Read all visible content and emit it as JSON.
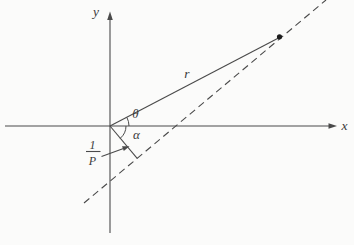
{
  "figure": {
    "canvas": {
      "width": 354,
      "height": 245,
      "background": "#fbfbfa"
    },
    "style": {
      "stroke_color": "#4a4a4a",
      "text_color": "#3a3a3a",
      "dot_color": "#1c1c1c",
      "stroke_width": 1.1,
      "dash_pattern": "7 4.5"
    },
    "lines": [
      {
        "name": "x-axis",
        "x1": 5,
        "y1": 126,
        "x2": 330,
        "y2": 126,
        "dash": false
      },
      {
        "name": "y-axis",
        "x1": 110,
        "y1": 19,
        "x2": 110,
        "y2": 233,
        "dash": false
      },
      {
        "name": "asymptote-dashed-line",
        "x1": 84,
        "y1": 203,
        "x2": 326,
        "y2": 0,
        "dash": true
      },
      {
        "name": "radius-vector-line",
        "x1": 110,
        "y1": 126,
        "x2": 278.5,
        "y2": 38,
        "dash": false
      },
      {
        "name": "perpendicular-segment",
        "x1": 110,
        "y1": 126,
        "x2": 137.2,
        "y2": 158.4,
        "dash": false
      },
      {
        "name": "fraction-bar",
        "x1": 86,
        "y1": 151.5,
        "x2": 100.5,
        "y2": 151.5,
        "dash": false
      },
      {
        "name": "pointer-arrow-shaft",
        "x1": 101.5,
        "y1": 156.5,
        "x2": 123.5,
        "y2": 148.5,
        "dash": false
      }
    ],
    "arcs": [
      {
        "name": "theta-angle-arc",
        "d": "M 129 126 A 19 19 0 0 0 126.9 117.4"
      },
      {
        "name": "alpha-angle-arc",
        "d": "M 126 126 A 16 16 0 0 1 120.2 138.3"
      }
    ],
    "polygons": [
      {
        "name": "x-axis-arrowhead",
        "points": "337,126 328.5,123.2 328.5,128.8"
      },
      {
        "name": "y-axis-arrowhead",
        "points": "110,11.5 107.2,20 112.8,20"
      },
      {
        "name": "pointer-arrowhead",
        "points": "129.5,146.2 123.8,151.0 122.0,146.2"
      }
    ],
    "circles": [
      {
        "name": "orbit-point-dot",
        "cx": 279.5,
        "cy": 36.8,
        "r": 2.6
      }
    ],
    "labels": [
      {
        "name": "y-axis-label",
        "text": "y",
        "x": 96,
        "y": 16,
        "size": 13.5
      },
      {
        "name": "x-axis-label",
        "text": "x",
        "x": 344.5,
        "y": 130,
        "size": 13.5
      },
      {
        "name": "radius-label",
        "text": "r",
        "x": 187,
        "y": 78,
        "size": 13.5
      },
      {
        "name": "theta-angle-label",
        "text": "θ",
        "x": 135.5,
        "y": 117.5,
        "size": 13
      },
      {
        "name": "alpha-angle-label",
        "text": "α",
        "x": 136.5,
        "y": 138.5,
        "size": 13
      },
      {
        "name": "fraction-numerator",
        "text": "1",
        "x": 92.5,
        "y": 148.5,
        "size": 12
      },
      {
        "name": "fraction-denominator",
        "text": "P",
        "x": 92.5,
        "y": 165,
        "size": 12
      }
    ]
  }
}
